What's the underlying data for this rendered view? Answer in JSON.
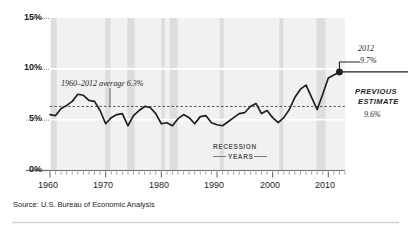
{
  "figure": {
    "source_note": "Source: U.S. Bureau of Economic Analysis",
    "background_color": "#ffffff",
    "line_color": "#231f20",
    "band_color": "#dcdddf",
    "plot_bg_color": "#f1f1f1",
    "average_line_color": "#6d6e71"
  },
  "annotations": {
    "average_label": "1960–2012 average 6.3%",
    "endpoint_year": "2012",
    "endpoint_value": "9.7%",
    "previous_estimate_title_line1": "PREVIOUS",
    "previous_estimate_title_line2": "ESTIMATE",
    "previous_estimate_value": "9.6%",
    "recession_line1": "RECESSION",
    "recession_line2": "YEARS"
  },
  "chart_data": {
    "type": "line",
    "title": "",
    "subtitle": "",
    "xlabel": "",
    "ylabel": "",
    "xlim": [
      1960,
      2013
    ],
    "ylim": [
      0,
      15
    ],
    "ytick_labels": [
      "0%",
      "5%",
      "10%",
      "15%"
    ],
    "ytick_values": [
      0,
      5,
      10,
      15
    ],
    "xtick_labels": [
      "1960",
      "1970",
      "1980",
      "1990",
      "2000",
      "2010"
    ],
    "xtick_values": [
      1960,
      1970,
      1980,
      1990,
      2000,
      2010
    ],
    "minor_xticks_every": 1,
    "grid": "horizontal-white-gridlines",
    "legend": "none",
    "average_value": 6.3,
    "endpoint": {
      "x": 2012,
      "y": 9.7,
      "marker": "filled-circle"
    },
    "previous_estimate": 9.6,
    "recession_bands": [
      [
        1960.2,
        1961.2
      ],
      [
        1969.9,
        1970.9
      ],
      [
        1973.9,
        1975.2
      ],
      [
        1980.0,
        1980.6
      ],
      [
        1981.5,
        1982.9
      ],
      [
        1990.5,
        1991.2
      ],
      [
        2001.2,
        2001.9
      ],
      [
        2007.9,
        2009.5
      ]
    ],
    "series": [
      {
        "name": "Corporate profits as share of GDP",
        "x": [
          1960,
          1961,
          1962,
          1963,
          1964,
          1965,
          1966,
          1967,
          1968,
          1969,
          1970,
          1971,
          1972,
          1973,
          1974,
          1975,
          1976,
          1977,
          1978,
          1979,
          1980,
          1981,
          1982,
          1983,
          1984,
          1985,
          1986,
          1987,
          1988,
          1989,
          1990,
          1991,
          1992,
          1993,
          1994,
          1995,
          1996,
          1997,
          1998,
          1999,
          2000,
          2001,
          2002,
          2003,
          2004,
          2005,
          2006,
          2007,
          2008,
          2009,
          2010,
          2011,
          2012
        ],
        "values": [
          5.5,
          5.4,
          6.1,
          6.4,
          6.8,
          7.5,
          7.4,
          6.9,
          6.8,
          5.9,
          4.6,
          5.2,
          5.5,
          5.6,
          4.4,
          5.4,
          5.9,
          6.3,
          6.2,
          5.6,
          4.6,
          4.7,
          4.4,
          5.1,
          5.5,
          5.2,
          4.6,
          5.3,
          5.4,
          4.7,
          4.5,
          4.4,
          4.8,
          5.2,
          5.6,
          5.7,
          6.3,
          6.6,
          5.6,
          5.9,
          5.2,
          4.7,
          5.2,
          6.0,
          7.2,
          8.0,
          8.4,
          7.2,
          6.0,
          7.5,
          9.1,
          9.4,
          9.7
        ]
      }
    ]
  }
}
